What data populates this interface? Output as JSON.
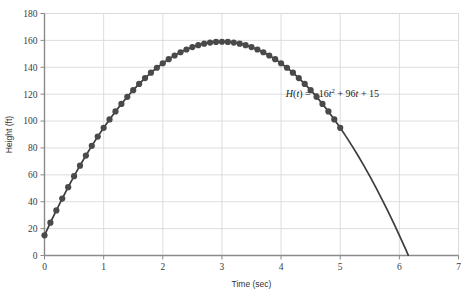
{
  "chart_data": {
    "type": "line",
    "title": "",
    "subtitle": "",
    "xlabel": "Time (sec)",
    "ylabel": "Height (ft)",
    "xlim": [
      0,
      7
    ],
    "ylim": [
      0,
      180
    ],
    "xticks": [
      "0",
      "1",
      "2",
      "3",
      "4",
      "5",
      "6",
      "7"
    ],
    "xtick_values": [
      0,
      1,
      2,
      3,
      4,
      5,
      6,
      7
    ],
    "yticks": [
      "0",
      "20",
      "40",
      "60",
      "80",
      "100",
      "120",
      "140",
      "160",
      "180"
    ],
    "ytick_values": [
      0,
      20,
      40,
      60,
      80,
      100,
      120,
      140,
      160,
      180
    ],
    "grid": true,
    "legend": "none",
    "annotations": [
      {
        "name": "equation-label",
        "text": "H(t) = -16t² + 96t + 15",
        "parts": {
          "fn_name": "H",
          "open": "(",
          "var1": "t",
          "close": ")",
          "equals": " = ",
          "a_coef": "−16",
          "var2": "t",
          "exponent": "2",
          "b_term": " + 96",
          "var3": "t",
          "c_term": " + 15"
        },
        "x": 4.08,
        "y": 118
      }
    ],
    "series": [
      {
        "name": "H(t) = -16t^2 + 96t + 15",
        "marker": "circle",
        "marker_color": "#4a4a4a",
        "line_color": "#3c3c3c",
        "marker_range": [
          0,
          5
        ],
        "formula_a": -16,
        "formula_b": 96,
        "formula_c": 15,
        "x": [
          0,
          0.1,
          0.2,
          0.3,
          0.4,
          0.5,
          0.6,
          0.7,
          0.8,
          0.9,
          1,
          1.1,
          1.2,
          1.3,
          1.4,
          1.5,
          1.6,
          1.7,
          1.8,
          1.9,
          2,
          2.1,
          2.2,
          2.3,
          2.4,
          2.5,
          2.6,
          2.7,
          2.8,
          2.9,
          3,
          3.1,
          3.2,
          3.3,
          3.4,
          3.5,
          3.6,
          3.7,
          3.8,
          3.9,
          4,
          4.1,
          4.2,
          4.3,
          4.4,
          4.5,
          4.6,
          4.7,
          4.8,
          4.9,
          5,
          5.1,
          5.2,
          5.3,
          5.4,
          5.5,
          5.6,
          5.7,
          5.8,
          5.9,
          6,
          6.1,
          6.15
        ],
        "values": [
          15,
          24.44,
          33.56,
          42.36,
          50.84,
          59,
          66.84,
          74.36,
          81.56,
          88.44,
          95,
          101.24,
          107.16,
          112.76,
          118.04,
          123,
          127.64,
          131.96,
          135.96,
          139.64,
          143,
          146.04,
          148.76,
          151.16,
          153.24,
          155,
          156.44,
          157.56,
          158.36,
          158.84,
          159,
          158.84,
          158.36,
          157.56,
          156.44,
          155,
          153.24,
          151.16,
          148.76,
          146.04,
          143,
          139.64,
          135.96,
          131.96,
          127.64,
          123,
          118.04,
          112.76,
          107.16,
          101.24,
          95,
          88.44,
          81.56,
          74.36,
          66.84,
          59,
          50.84,
          42.36,
          33.56,
          24.44,
          15,
          5.24,
          0.24
        ]
      }
    ],
    "colors": {
      "background": "#ffffff",
      "grid": "#d9d9d9",
      "axis": "#808080",
      "data": "#3f3f3f",
      "text": "#333333",
      "border": "#e8e8e8"
    }
  }
}
